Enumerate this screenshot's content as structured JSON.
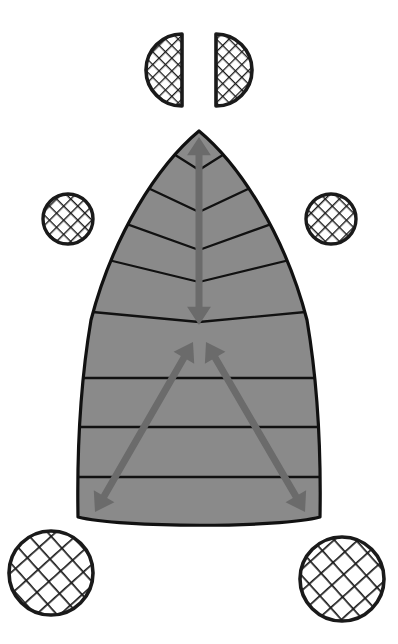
{
  "figure": {
    "title": "Leaf diagram with hatched circle markers and growth direction arrows",
    "caption": "",
    "background_color": "#ffffff",
    "canvas": {
      "width": 398,
      "height": 644
    }
  },
  "colors": {
    "leaf_fill": "#8a8a8a",
    "leaf_outline": "#111111",
    "vein_line": "#111111",
    "arrow": "#6b6b6b",
    "hatch_stroke": "#1a1a1a",
    "circle_outline": "#1a1a1a",
    "circle_fill": "#ffffff"
  },
  "leaf": {
    "name": "leaf-blade",
    "apex": {
      "x": 199,
      "y": 131
    },
    "base_left": {
      "x": 78,
      "y": 517
    },
    "base_right": {
      "x": 320,
      "y": 517
    },
    "base_center": {
      "x": 199,
      "y": 526
    },
    "outline_stroke_width": 3,
    "upper_veins_count": 5,
    "lower_lines_count": 3,
    "upper_vein_midrib_y": [
      170,
      212,
      250,
      282,
      322
    ],
    "lower_line_y": [
      378,
      427,
      477
    ]
  },
  "arrows": {
    "midrib": {
      "name": "midrib-arrow",
      "label": "vertical double-headed arrow along midrib",
      "from": {
        "x": 199,
        "y": 137
      },
      "to": {
        "x": 199,
        "y": 325
      },
      "double_headed": true,
      "shaft_width": 7
    },
    "v_left": {
      "name": "v-left-arrow",
      "label": "double-headed arrow from center to lower-left corner",
      "from": {
        "x": 193,
        "y": 342
      },
      "to": {
        "x": 95,
        "y": 512
      },
      "double_headed": true,
      "shaft_width": 7
    },
    "v_right": {
      "name": "v-right-arrow",
      "label": "double-headed arrow from center to lower-right corner",
      "from": {
        "x": 206,
        "y": 342
      },
      "to": {
        "x": 305,
        "y": 512
      },
      "double_headed": true,
      "shaft_width": 7
    }
  },
  "markers": [
    {
      "name": "half-circle-top-left",
      "shape": "half-circle",
      "orientation": "flat-edge-right",
      "center": {
        "x": 182,
        "y": 70
      },
      "radius": 36,
      "hatch": "crosshatch-fine",
      "hatch_spacing": 9
    },
    {
      "name": "half-circle-top-right",
      "shape": "half-circle",
      "orientation": "flat-edge-left",
      "center": {
        "x": 216,
        "y": 70
      },
      "radius": 36,
      "hatch": "crosshatch-fine",
      "hatch_spacing": 9
    },
    {
      "name": "circle-mid-left",
      "shape": "circle",
      "center": {
        "x": 68,
        "y": 219
      },
      "radius": 25,
      "hatch": "crosshatch-medium",
      "hatch_spacing": 10
    },
    {
      "name": "circle-mid-right",
      "shape": "circle",
      "center": {
        "x": 331,
        "y": 219
      },
      "radius": 25,
      "hatch": "crosshatch-medium",
      "hatch_spacing": 10
    },
    {
      "name": "circle-bottom-left",
      "shape": "circle",
      "center": {
        "x": 51,
        "y": 573
      },
      "radius": 42,
      "hatch": "crosshatch-coarse",
      "hatch_spacing": 16
    },
    {
      "name": "circle-bottom-right",
      "shape": "circle",
      "center": {
        "x": 342,
        "y": 579
      },
      "radius": 42,
      "hatch": "crosshatch-coarse",
      "hatch_spacing": 16
    }
  ]
}
